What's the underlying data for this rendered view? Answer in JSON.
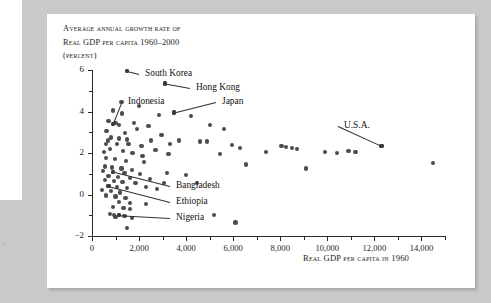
{
  "figure": {
    "folio": "6",
    "y_axis_title_lines": [
      "Average annual growth rate of",
      "Real GDP per capita 1960–2000",
      "(percent)"
    ],
    "x_axis_title": "Real GDP per capita in 1960"
  },
  "chart_data": {
    "type": "scatter",
    "title": "Average annual growth rate of Real GDP per capita 1960–2000 (percent)",
    "xlabel": "Real GDP per capita in 1960",
    "ylabel": "Average annual growth rate of Real GDP per capita 1960–2000 (percent)",
    "xlim": [
      0,
      15000
    ],
    "ylim": [
      -2,
      6
    ],
    "grid": false,
    "legend": "none",
    "x_ticks": [
      0,
      2000,
      4000,
      6000,
      8000,
      10000,
      12000,
      14000
    ],
    "x_tick_labels": [
      "0",
      "2,000",
      "4,000",
      "6,000",
      "8,000",
      "10,000",
      "12,000",
      "14,000"
    ],
    "x_minor_ticks": [
      1000,
      3000,
      5000,
      7000,
      9000,
      11000,
      13000,
      15000
    ],
    "y_ticks": [
      -2,
      0,
      2,
      4,
      6
    ],
    "y_tick_labels": [
      "−2",
      "0",
      "2",
      "4",
      "6"
    ],
    "y_minor_ticks": [
      -1,
      1,
      3,
      5
    ],
    "annotations": [
      {
        "label": "South Korea",
        "x": 1500,
        "y": 5.95
      },
      {
        "label": "Hong Kong",
        "x": 3100,
        "y": 5.35
      },
      {
        "label": "Japan",
        "x": 3500,
        "y": 3.95
      },
      {
        "label": "Indonesia",
        "x": 900,
        "y": 3.4
      },
      {
        "label": "U.S.A.",
        "x": 12300,
        "y": 2.35
      },
      {
        "label": "Bangladesh",
        "x": 900,
        "y": 1.1
      },
      {
        "label": "Ethiopia",
        "x": 700,
        "y": 0.4
      },
      {
        "label": "Nigeria",
        "x": 1150,
        "y": -1.0
      }
    ],
    "points": [
      [
        1500,
        5.95
      ],
      [
        3100,
        5.35
      ],
      [
        1250,
        4.45
      ],
      [
        2000,
        4.25
      ],
      [
        900,
        4.05
      ],
      [
        3500,
        3.95
      ],
      [
        2850,
        3.85
      ],
      [
        4200,
        3.8
      ],
      [
        700,
        3.55
      ],
      [
        1000,
        3.45
      ],
      [
        900,
        3.4
      ],
      [
        1150,
        3.35
      ],
      [
        5000,
        3.35
      ],
      [
        620,
        3.05
      ],
      [
        1900,
        3.15
      ],
      [
        5600,
        3.15
      ],
      [
        1400,
        2.95
      ],
      [
        800,
        2.75
      ],
      [
        1150,
        2.7
      ],
      [
        1500,
        2.65
      ],
      [
        2500,
        2.6
      ],
      [
        4900,
        2.55
      ],
      [
        600,
        2.45
      ],
      [
        1050,
        2.45
      ],
      [
        2100,
        2.35
      ],
      [
        5950,
        2.4
      ],
      [
        780,
        2.2
      ],
      [
        1320,
        2.1
      ],
      [
        2700,
        2.15
      ],
      [
        6300,
        2.25
      ],
      [
        520,
        2.05
      ],
      [
        1720,
        2.0
      ],
      [
        3250,
        1.95
      ],
      [
        7400,
        2.05
      ],
      [
        8050,
        2.35
      ],
      [
        8250,
        2.3
      ],
      [
        8500,
        2.25
      ],
      [
        8700,
        2.2
      ],
      [
        9900,
        2.05
      ],
      [
        10400,
        2.0
      ],
      [
        10900,
        2.1
      ],
      [
        11200,
        2.05
      ],
      [
        12300,
        2.35
      ],
      [
        14500,
        1.5
      ],
      [
        600,
        1.75
      ],
      [
        980,
        1.7
      ],
      [
        1450,
        1.6
      ],
      [
        2200,
        1.55
      ],
      [
        6550,
        1.45
      ],
      [
        540,
        1.35
      ],
      [
        860,
        1.3
      ],
      [
        1250,
        1.25
      ],
      [
        1700,
        1.2
      ],
      [
        480,
        1.15
      ],
      [
        900,
        1.1
      ],
      [
        1380,
        1.05
      ],
      [
        2050,
        1.0
      ],
      [
        3200,
        1.05
      ],
      [
        700,
        0.9
      ],
      [
        1100,
        0.85
      ],
      [
        1600,
        0.8
      ],
      [
        2450,
        0.75
      ],
      [
        560,
        0.7
      ],
      [
        950,
        0.65
      ],
      [
        1300,
        0.6
      ],
      [
        1850,
        0.55
      ],
      [
        700,
        0.4
      ],
      [
        1050,
        0.35
      ],
      [
        1500,
        0.3
      ],
      [
        2300,
        0.35
      ],
      [
        430,
        0.2
      ],
      [
        820,
        0.15
      ],
      [
        1200,
        0.1
      ],
      [
        2750,
        0.25
      ],
      [
        600,
        -0.05
      ],
      [
        1000,
        -0.1
      ],
      [
        1420,
        -0.15
      ],
      [
        3050,
        0.55
      ],
      [
        1150,
        -0.35
      ],
      [
        1620,
        -0.4
      ],
      [
        2300,
        -0.45
      ],
      [
        880,
        -0.6
      ],
      [
        1340,
        -0.65
      ],
      [
        1600,
        -0.7
      ],
      [
        4450,
        0.55
      ],
      [
        750,
        -0.95
      ],
      [
        950,
        -1.0
      ],
      [
        1150,
        -1.0
      ],
      [
        1380,
        -1.05
      ],
      [
        1000,
        -1.1
      ],
      [
        5200,
        -1.0
      ],
      [
        6100,
        -1.35
      ],
      [
        1500,
        -1.6
      ],
      [
        1700,
        -1.15
      ],
      [
        9100,
        1.25
      ],
      [
        4000,
        0.95
      ],
      [
        4600,
        2.55
      ],
      [
        5450,
        1.95
      ],
      [
        3700,
        2.6
      ],
      [
        2950,
        2.85
      ],
      [
        2400,
        3.3
      ],
      [
        3300,
        2.45
      ],
      [
        2150,
        1.85
      ],
      [
        1800,
        3.45
      ],
      [
        1280,
        3.9
      ],
      [
        680,
        2.6
      ],
      [
        1550,
        2.45
      ]
    ]
  }
}
